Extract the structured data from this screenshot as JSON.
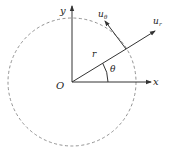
{
  "diagram": {
    "type": "polar-coordinates",
    "labels": {
      "y_axis": "y",
      "x_axis": "x",
      "origin": "O",
      "radius": "r",
      "angle": "θ",
      "radial_unit": "u",
      "radial_sub": "r",
      "transverse_unit": "u",
      "transverse_sub": "θ"
    },
    "colors": {
      "stroke": "#333333",
      "circle": "#777777",
      "background": "#ffffff"
    }
  }
}
